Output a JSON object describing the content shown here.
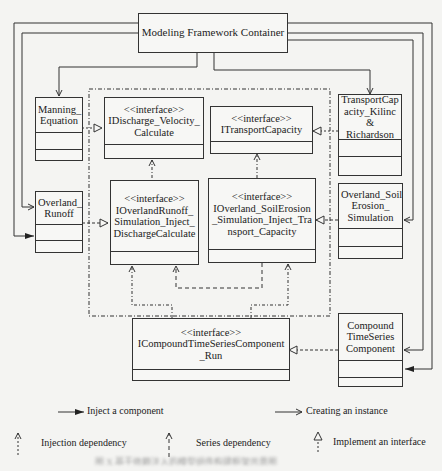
{
  "container": {
    "label": "Modeling Framework Container"
  },
  "components": {
    "manning": {
      "label": "Manning_ Equation"
    },
    "overland_runoff": {
      "label": "Overland_ Runoff"
    },
    "transport_capacity": {
      "label": "TransportCap acity_Kilinc & Richardson"
    },
    "overland_soil": {
      "label": "Overland_Soil Erosion_ Simulation"
    },
    "compound": {
      "label": "Compound TimeSeries Component"
    }
  },
  "interfaces": {
    "stereotype": "<<interface>>",
    "discharge": {
      "name": "IDischarge_Velocity_ Calculate"
    },
    "transport": {
      "name": "ITransportCapacity"
    },
    "runoff_sim": {
      "name": "IOverlandRunoff_ Simulation_Inject_ DischargeCalculate"
    },
    "soil_sim": {
      "name": "IOverland_SoilErosion _Simulation_Inject_Tra nsport_Capacity"
    },
    "compound_run": {
      "name": "ICompoundTimeSeriesComponent _Run"
    }
  },
  "legend": {
    "inject": "Inject a component",
    "create": "Creating an instance",
    "injection_dep": "Injection dependency",
    "series_dep": "Series dependency",
    "implement": "Implement an interface"
  },
  "caption": "图 X  基于依赖注入的模型组件构建框架示意图"
}
